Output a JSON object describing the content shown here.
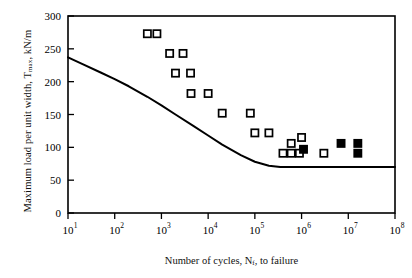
{
  "chart_data": {
    "type": "scatter",
    "title": "",
    "xlabel": "Number of cycles, N_f, to failure",
    "xlabel_parts": {
      "pre": "Number of cycles, N",
      "sub": "f",
      "post": ", to failure"
    },
    "ylabel": "Maximum load per unit width, T_max, kN/m",
    "ylabel_parts": {
      "pre": "Maximum load per unit width, T",
      "sub": "max",
      "post": ", kN/m"
    },
    "xscale": "log",
    "yscale": "linear",
    "xlim": [
      10,
      100000000
    ],
    "ylim": [
      0,
      300
    ],
    "xticks": [
      10,
      100,
      1000,
      10000,
      100000,
      1000000,
      10000000,
      100000000
    ],
    "xtick_labels": [
      "10^1",
      "10^2",
      "10^3",
      "10^4",
      "10^5",
      "10^6",
      "10^7",
      "10^8"
    ],
    "xtick_exponents": [
      "1",
      "2",
      "3",
      "4",
      "5",
      "6",
      "7",
      "8"
    ],
    "xtick_mantissa": "10",
    "yticks": [
      0,
      50,
      100,
      150,
      200,
      250,
      300
    ],
    "ytick_labels": [
      "0",
      "50",
      "100",
      "150",
      "200",
      "250",
      "300"
    ],
    "grid": false,
    "legend": false,
    "frame": true,
    "series": [
      {
        "name": "open-square",
        "marker": "square-open",
        "color": "#000000",
        "fill": "#ffffff",
        "points": [
          {
            "x": 500,
            "y": 273
          },
          {
            "x": 800,
            "y": 273
          },
          {
            "x": 1500,
            "y": 243
          },
          {
            "x": 2900,
            "y": 243
          },
          {
            "x": 2000,
            "y": 213
          },
          {
            "x": 4200,
            "y": 213
          },
          {
            "x": 4300,
            "y": 182
          },
          {
            "x": 10000,
            "y": 182
          },
          {
            "x": 20000,
            "y": 152
          },
          {
            "x": 80000,
            "y": 152
          },
          {
            "x": 100000,
            "y": 122
          },
          {
            "x": 200000,
            "y": 122
          },
          {
            "x": 600000,
            "y": 106
          },
          {
            "x": 1000000,
            "y": 115
          },
          {
            "x": 400000,
            "y": 91
          },
          {
            "x": 600000,
            "y": 91
          },
          {
            "x": 900000,
            "y": 91
          },
          {
            "x": 3000000,
            "y": 91
          }
        ]
      },
      {
        "name": "filled-square",
        "marker": "square-filled",
        "color": "#000000",
        "fill": "#000000",
        "points": [
          {
            "x": 1100000,
            "y": 97
          },
          {
            "x": 7000000,
            "y": 106
          },
          {
            "x": 16000000,
            "y": 106
          },
          {
            "x": 16000000,
            "y": 91
          }
        ]
      }
    ],
    "curve": {
      "name": "design-curve",
      "color": "#000000",
      "width": 2,
      "points": [
        {
          "x": 10,
          "y": 237
        },
        {
          "x": 20,
          "y": 227
        },
        {
          "x": 50,
          "y": 214
        },
        {
          "x": 100,
          "y": 204
        },
        {
          "x": 200,
          "y": 193
        },
        {
          "x": 500,
          "y": 177
        },
        {
          "x": 1000,
          "y": 164
        },
        {
          "x": 2000,
          "y": 150
        },
        {
          "x": 5000,
          "y": 132
        },
        {
          "x": 10000,
          "y": 118
        },
        {
          "x": 20000,
          "y": 104
        },
        {
          "x": 50000,
          "y": 88
        },
        {
          "x": 100000,
          "y": 78
        },
        {
          "x": 200000,
          "y": 72
        },
        {
          "x": 350000,
          "y": 70
        },
        {
          "x": 1000000,
          "y": 70
        },
        {
          "x": 10000000,
          "y": 70
        },
        {
          "x": 100000000,
          "y": 70
        }
      ]
    }
  }
}
